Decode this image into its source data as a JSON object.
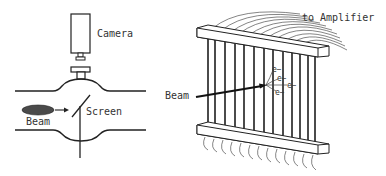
{
  "left_diagram": {
    "labels": {
      "camera": "Camera",
      "screen": "Screen",
      "beam": "Beam"
    }
  },
  "right_diagram": {
    "labels": {
      "amplifier": "to Amplifier",
      "beam": "Beam",
      "electrons": [
        "e−",
        "e−",
        "e−",
        "e−"
      ]
    },
    "wire_count": 13
  },
  "colors": {
    "line": "#222222",
    "text": "#333333",
    "beam_fill": "#4a4a4a",
    "background": "#ffffff"
  }
}
